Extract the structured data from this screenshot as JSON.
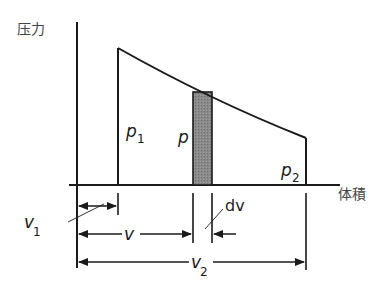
{
  "diagram": {
    "y_axis_label": "压力",
    "x_axis_label": "体積",
    "labels": {
      "p1": {
        "base": "p",
        "sub": "1"
      },
      "p": {
        "base": "p"
      },
      "p2": {
        "base": "p",
        "sub": "2"
      },
      "v1": {
        "base": "v",
        "sub": "1"
      },
      "v": {
        "base": "v"
      },
      "v2": {
        "base": "v",
        "sub": "2"
      },
      "dv": "dv"
    },
    "colors": {
      "line": "#1a1a1a",
      "strip_fill": "#8a8a8a"
    }
  }
}
